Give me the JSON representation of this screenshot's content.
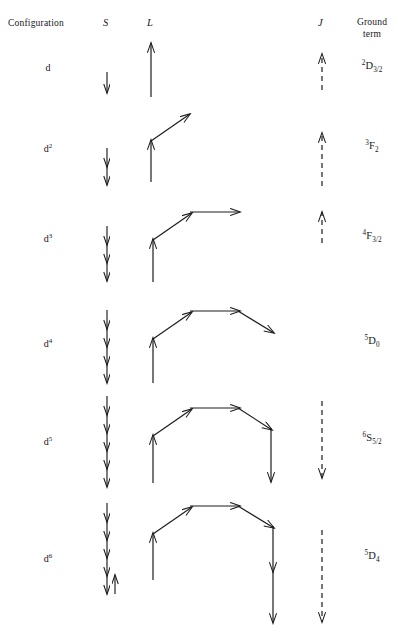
{
  "figure": {
    "stroke_color": "#1c1c1c",
    "background_color": "#ffffff"
  },
  "headers": {
    "configuration": "Configuration",
    "spin": "S",
    "orbital": "L",
    "total": "J",
    "ground_line1": "Ground",
    "ground_line2": "term"
  },
  "rows": [
    {
      "configuration_base": "d",
      "configuration_exponent": "",
      "spin_down_count": 1,
      "spin_paired_up": false,
      "ground_term": {
        "multiplicity": "2",
        "letter": "D",
        "j": "3/2"
      },
      "j_arrow": "up",
      "l_segments": [
        "up"
      ]
    },
    {
      "configuration_base": "d",
      "configuration_exponent": "2",
      "spin_down_count": 2,
      "spin_paired_up": false,
      "ground_term": {
        "multiplicity": "3",
        "letter": "F",
        "j": "2"
      },
      "j_arrow": "up",
      "l_segments": [
        "up",
        "diag-up-right"
      ]
    },
    {
      "configuration_base": "d",
      "configuration_exponent": "3",
      "spin_down_count": 3,
      "spin_paired_up": false,
      "ground_term": {
        "multiplicity": "4",
        "letter": "F",
        "j": "3/2"
      },
      "j_arrow": "up",
      "l_segments": [
        "up",
        "diag-up-right",
        "right"
      ]
    },
    {
      "configuration_base": "d",
      "configuration_exponent": "4",
      "spin_down_count": 4,
      "spin_paired_up": false,
      "ground_term": {
        "multiplicity": "5",
        "letter": "D",
        "j": "0"
      },
      "j_arrow": "none",
      "l_segments": [
        "up",
        "diag-up-right",
        "right",
        "diag-down-right"
      ]
    },
    {
      "configuration_base": "d",
      "configuration_exponent": "5",
      "spin_down_count": 5,
      "spin_paired_up": false,
      "ground_term": {
        "multiplicity": "6",
        "letter": "S",
        "j": "5/2"
      },
      "j_arrow": "down",
      "l_segments": [
        "up",
        "diag-up-right",
        "right",
        "diag-down-right",
        "down"
      ]
    },
    {
      "configuration_base": "d",
      "configuration_exponent": "6",
      "spin_down_count": 5,
      "spin_paired_up": true,
      "ground_term": {
        "multiplicity": "5",
        "letter": "D",
        "j": "4"
      },
      "j_arrow": "down",
      "l_segments": [
        "up",
        "diag-up-right",
        "right",
        "diag-down-right",
        "down-long"
      ]
    }
  ]
}
